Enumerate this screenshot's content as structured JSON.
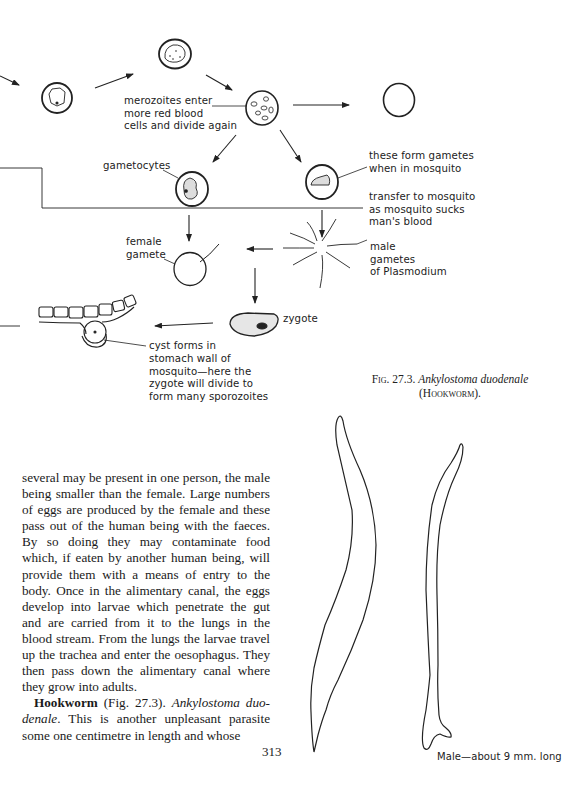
{
  "diagram": {
    "labels": {
      "merozoites": [
        "merozoites enter",
        "more red blood",
        "cells and divide again"
      ],
      "gametocytes": "gametocytes",
      "form_gametes": [
        "these form gametes",
        "when in mosquito"
      ],
      "transfer": [
        "transfer to mosquito",
        "as mosquito sucks",
        "man's blood"
      ],
      "female_gamete": [
        "female",
        "gamete"
      ],
      "male_gametes": [
        "male",
        "gametes",
        "of Plasmodium"
      ],
      "zygote": "zygote",
      "cyst": [
        "cyst forms in",
        "stomach wall of",
        "mosquito—here the",
        "zygote will divide to",
        "form many sporozoites"
      ]
    }
  },
  "figure": {
    "fig_label": "Fig. 27.3.",
    "species": "Ankylostoma duodenale",
    "common_name": "(Hookworm).",
    "male_label": "Male—about 9 mm. long"
  },
  "body": {
    "para1": "several may be present in one person, the male being smaller than the female. Large numbers of eggs are produced by the female and these pass out of the human being with the faeces. By so doing they may contaminate food which, if eaten by another human being, will provide them with a means of entry to the body. Once in the alimentary canal, the eggs develop into larvae which penetrate the gut and are carried from it to the lungs in the blood stream. From the lungs the larvae travel up the trachea and enter the oeso­phagus. They then pass down the alimentary canal where they grow into adults.",
    "para2_heading": "Hookworm",
    "para2_ref": " (Fig. 27.3). ",
    "para2_species": "Ankylostoma duo­denale",
    "para2_text": ". This is another unpleasant parasite some one centimetre in length and whose"
  },
  "page_number": "313"
}
